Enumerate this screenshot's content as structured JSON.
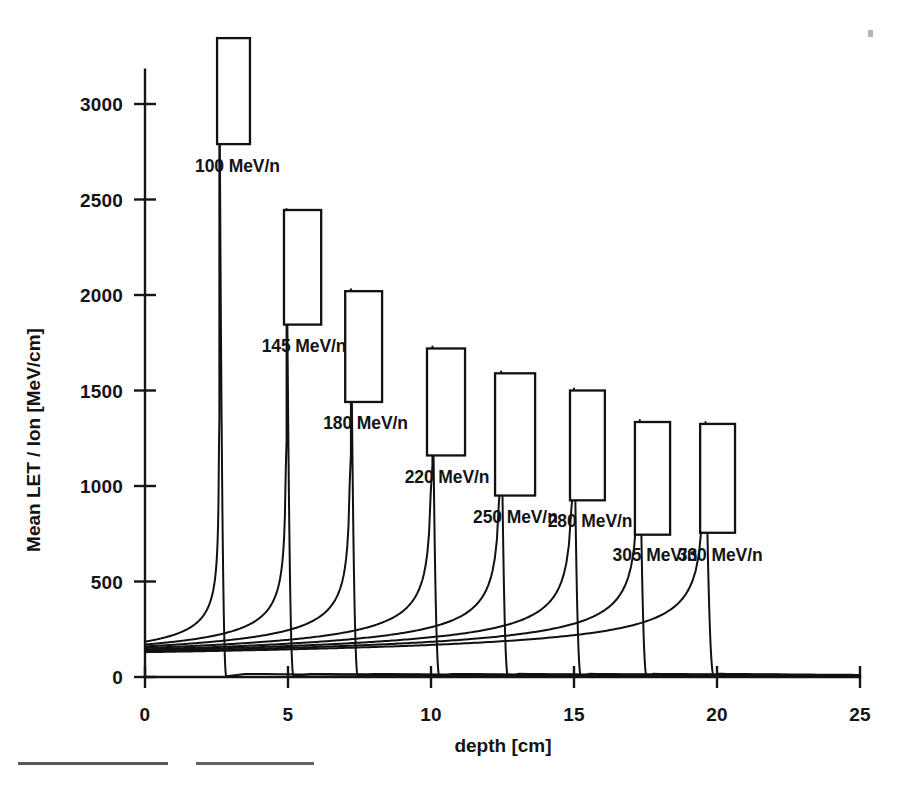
{
  "figure": {
    "background_color": "#ffffff",
    "ink_color": "#141414"
  },
  "axes": {
    "y_title": "Mean LET / Ion  [MeV/cm]",
    "x_title": "depth [cm]",
    "y_ticks": [
      "0",
      "500",
      "1000",
      "1500",
      "2000",
      "2500",
      "3000"
    ],
    "x_ticks": [
      "0",
      "5",
      "10",
      "15",
      "20",
      "25"
    ]
  },
  "chart_data": {
    "type": "line",
    "title": "",
    "xlabel": "depth [cm]",
    "ylabel": "Mean LET / Ion  [MeV/cm]",
    "xlim": [
      0,
      25
    ],
    "ylim": [
      0,
      3300
    ],
    "xticks": [
      0,
      5,
      10,
      15,
      20,
      25
    ],
    "yticks": [
      0,
      500,
      1000,
      1500,
      2000,
      2500,
      3000
    ],
    "grid": false,
    "legend": "inline-annotations",
    "series": [
      {
        "name": "100 MeV/n",
        "label": "100 MeV/n",
        "peak_depth_cm": 2.6,
        "peak_let": 3300,
        "plateau_let": 185,
        "range_end_cm": 2.85
      },
      {
        "name": "145 MeV/n",
        "label": "145 MeV/n",
        "peak_depth_cm": 4.95,
        "peak_let": 2450,
        "plateau_let": 170,
        "range_end_cm": 5.2
      },
      {
        "name": "180 MeV/n",
        "label": "180 MeV/n",
        "peak_depth_cm": 7.2,
        "peak_let": 2030,
        "plateau_let": 160,
        "range_end_cm": 7.45
      },
      {
        "name": "220 MeV/n",
        "label": "220 MeV/n",
        "peak_depth_cm": 10.05,
        "peak_let": 1730,
        "plateau_let": 152,
        "range_end_cm": 10.3
      },
      {
        "name": "250 MeV/n",
        "label": "250 MeV/n",
        "peak_depth_cm": 12.45,
        "peak_let": 1600,
        "plateau_let": 145,
        "range_end_cm": 12.7
      },
      {
        "name": "280 MeV/n",
        "label": "280 MeV/n",
        "peak_depth_cm": 15.0,
        "peak_let": 1510,
        "plateau_let": 140,
        "range_end_cm": 15.25
      },
      {
        "name": "305 MeV/n",
        "label": "305 MeV/n",
        "peak_depth_cm": 17.3,
        "peak_let": 1345,
        "plateau_let": 135,
        "range_end_cm": 17.55
      },
      {
        "name": "330 MeV/n",
        "label": "330 MeV/n",
        "peak_depth_cm": 19.6,
        "peak_let": 1335,
        "plateau_let": 130,
        "range_end_cm": 19.9
      }
    ],
    "peak_boxes": [
      {
        "series": "100 MeV/n",
        "x0_cm": 2.52,
        "x1_cm": 3.67,
        "y0_let": 2790,
        "y1_let": 3345
      },
      {
        "series": "145 MeV/n",
        "x0_cm": 4.86,
        "x1_cm": 6.16,
        "y0_let": 1845,
        "y1_let": 2445
      },
      {
        "series": "180 MeV/n",
        "x0_cm": 7.0,
        "x1_cm": 8.29,
        "y0_let": 1440,
        "y1_let": 2020
      },
      {
        "series": "220 MeV/n",
        "x0_cm": 9.86,
        "x1_cm": 11.19,
        "y0_let": 1160,
        "y1_let": 1720
      },
      {
        "series": "250 MeV/n",
        "x0_cm": 12.24,
        "x1_cm": 13.64,
        "y0_let": 950,
        "y1_let": 1590
      },
      {
        "series": "280 MeV/n",
        "x0_cm": 14.86,
        "x1_cm": 16.08,
        "y0_let": 925,
        "y1_let": 1500
      },
      {
        "series": "305 MeV/n",
        "x0_cm": 17.13,
        "x1_cm": 18.36,
        "y0_let": 745,
        "y1_let": 1335
      },
      {
        "series": "330 MeV/n",
        "x0_cm": 19.41,
        "x1_cm": 20.63,
        "y0_let": 755,
        "y1_let": 1325
      }
    ],
    "annotations": [
      {
        "text": "100 MeV/n",
        "x_cm": 1.75,
        "y_let": 2645
      },
      {
        "text": "145 MeV/n",
        "x_cm": 4.08,
        "y_let": 1700
      },
      {
        "text": "180 MeV/n",
        "x_cm": 6.23,
        "y_let": 1298
      },
      {
        "text": "220 MeV/n",
        "x_cm": 9.08,
        "y_let": 1018
      },
      {
        "text": "250 MeV/n",
        "x_cm": 11.47,
        "y_let": 805
      },
      {
        "text": "280 MeV/n",
        "x_cm": 14.08,
        "y_let": 785
      },
      {
        "text": "305 MeV/n",
        "x_cm": 16.35,
        "y_let": 605
      },
      {
        "text": "330 MeV/n",
        "x_cm": 18.63,
        "y_let": 608
      }
    ]
  }
}
